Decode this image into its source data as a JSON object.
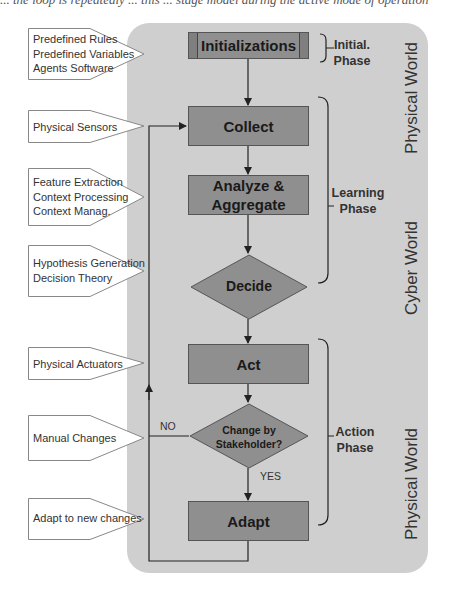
{
  "caption_partial": "... the loop is repeatedly ... this ... stage model during the active mode of operation",
  "flow_nodes": {
    "init": "Initializations",
    "collect": "Collect",
    "analyze_line1": "Analyze &",
    "analyze_line2": "Aggregate",
    "decide": "Decide",
    "act": "Act",
    "change_line1": "Change by",
    "change_line2": "Stakeholder?",
    "adapt": "Adapt"
  },
  "edge_labels": {
    "no": "NO",
    "yes": "YES"
  },
  "callouts": [
    {
      "lines": [
        "Predefined Rules",
        "Predefined Variables",
        "Agents Software"
      ]
    },
    {
      "lines": [
        "Physical Sensors"
      ]
    },
    {
      "lines": [
        "Feature Extraction",
        "Context Processing",
        "Context Manag."
      ]
    },
    {
      "lines": [
        "Hypothesis Generation",
        "Decision Theory"
      ]
    },
    {
      "lines": [
        "Physical Actuators"
      ]
    },
    {
      "lines": [
        "Manual Changes"
      ]
    },
    {
      "lines": [
        "Adapt to new changes"
      ]
    }
  ],
  "phases": {
    "initial_1": "Initial.",
    "initial_2": "Phase",
    "learning_1": "Learning",
    "learning_2": "Phase",
    "action_1": "Action",
    "action_2": "Phase"
  },
  "worlds": {
    "top": "Physical World",
    "middle": "Cyber World",
    "bottom": "Physical World"
  },
  "colors": {
    "panel": "#cfcfcf",
    "node_fill": "#8f8f8f",
    "node_border": "#555555"
  }
}
